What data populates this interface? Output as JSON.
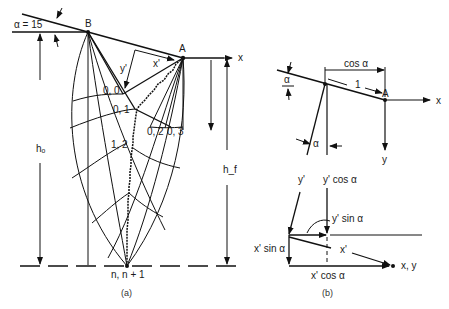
{
  "figure_a": {
    "caption": "(a)",
    "alpha_label": "α = 15",
    "point_b": "B",
    "point_a": "A",
    "axis_x": "x",
    "y_prime": "y'",
    "x_prime": "x'",
    "h_o": "hₒ",
    "h_f": "h_f",
    "node_labels": [
      "0, 0",
      "0, 1",
      "0, 2",
      "0, 3",
      "1, 2"
    ],
    "bottom_label": "n, n + 1"
  },
  "figure_b": {
    "caption": "(b)",
    "alpha_top": "α",
    "alpha_mid": "α",
    "cos_alpha": "cos α",
    "one": "1",
    "point_a": "A",
    "axis_x": "x",
    "axis_y": "y",
    "y_prime": "y'",
    "y_cos": "y' cos α",
    "y_sin": "y' sin α",
    "x_sin": "x' sin α",
    "x_prime": "x'",
    "x_cos": "x' cos α",
    "xy_label": "x, y"
  }
}
